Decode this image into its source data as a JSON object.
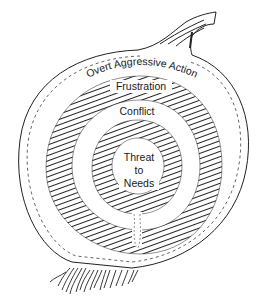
{
  "diagram": {
    "type": "onion-layers",
    "layers": [
      {
        "level": 1,
        "label": "Overt Aggressive Action",
        "style": "plain"
      },
      {
        "level": 2,
        "label": "Frustration",
        "style": "hatched"
      },
      {
        "level": 3,
        "label": "Conflict",
        "style": "plain"
      },
      {
        "level": 4,
        "label": "Threat to Needs",
        "lines": [
          "Threat",
          "to",
          "Needs"
        ],
        "style": "hatched-core"
      }
    ],
    "decorations": [
      "stem",
      "roots"
    ],
    "colors": {
      "ink": "#1a1a1a",
      "background": "#ffffff"
    }
  }
}
